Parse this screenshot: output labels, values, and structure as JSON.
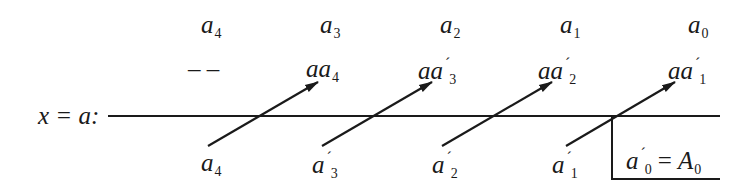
{
  "diagram": {
    "row_label": "x = a:",
    "top_row": [
      {
        "base": "a",
        "sub": "4"
      },
      {
        "base": "a",
        "sub": "3"
      },
      {
        "base": "a",
        "sub": "2"
      },
      {
        "base": "a",
        "sub": "1"
      },
      {
        "base": "a",
        "sub": "0"
      }
    ],
    "middle_row": [
      {
        "text": "– –"
      },
      {
        "base": "aa",
        "prime": "",
        "sub": "4"
      },
      {
        "base": "aa",
        "prime": "´",
        "sub": "3"
      },
      {
        "base": "aa",
        "prime": "´",
        "sub": "2"
      },
      {
        "base": "aa",
        "prime": "´",
        "sub": "1"
      }
    ],
    "bottom_row": [
      {
        "base": "a",
        "prime": "",
        "sub": "4"
      },
      {
        "base": "a",
        "prime": "´",
        "sub": "3"
      },
      {
        "base": "a",
        "prime": "´",
        "sub": "2"
      },
      {
        "base": "a",
        "prime": "´",
        "sub": "1"
      }
    ],
    "result": {
      "base": "a",
      "prime": "´",
      "sub": "0",
      "equals": "=",
      "rhs_base": "A",
      "rhs_sub": "0"
    },
    "colors": {
      "line": "#1a1a1a",
      "text": "#1a1a1a",
      "background": "#ffffff"
    }
  }
}
